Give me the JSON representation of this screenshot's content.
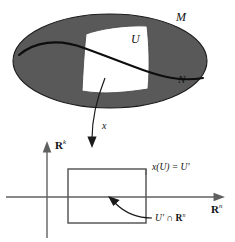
{
  "figure": {
    "colors": {
      "manifold_fill": "#595959",
      "manifold_stroke": "#1a1a1a",
      "patch_fill": "#ffffff",
      "patch_stroke": "#4a4a4a",
      "curve_stroke": "#0d0d0d",
      "axis_stroke": "#606060",
      "square_stroke": "#595959",
      "arrow_stroke": "#1a1a1a",
      "background": "#ffffff"
    },
    "upper": {
      "manifold_label": "M",
      "submanifold_label": "N",
      "chart_domain_label": "U",
      "shape": "ellipse",
      "patch_shape": "irregular-quadrilateral"
    },
    "map": {
      "label": "x",
      "description": "chart map arrow from U to U prime"
    },
    "lower": {
      "vertical_axis_label": "R",
      "vertical_axis_exponent": "k",
      "horizontal_axis_label": "R",
      "horizontal_axis_exponent": "n",
      "image_label_prefix": "x(U) = U",
      "image_label_prime": "′",
      "boundary_label_prefix": "U",
      "boundary_label_prime": "′",
      "boundary_label_suffix": " ∩ ",
      "boundary_label_space": "R",
      "boundary_label_exponent": "n"
    }
  }
}
